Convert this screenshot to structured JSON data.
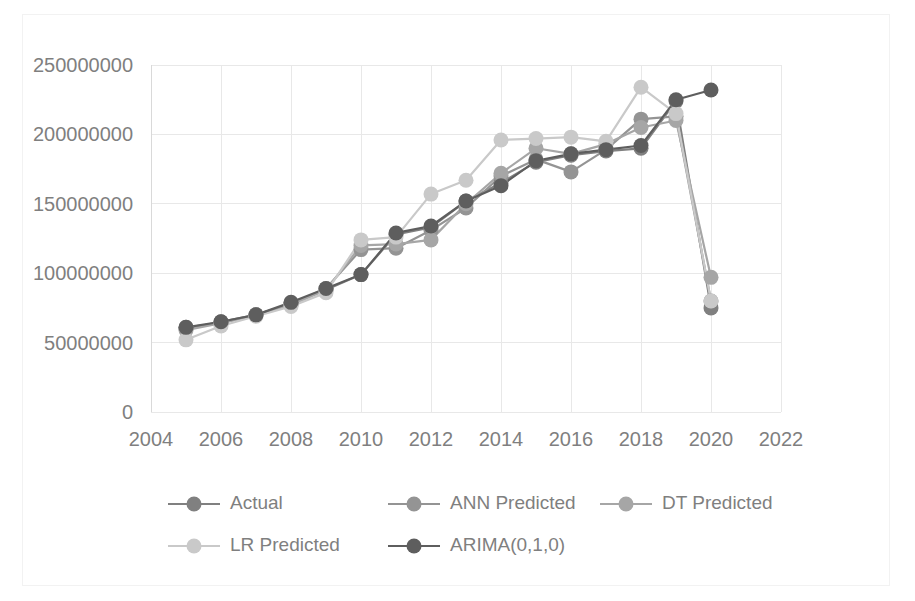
{
  "chart_data": {
    "type": "line",
    "title": "",
    "subtitle": "",
    "xlabel": "",
    "ylabel": "",
    "x": [
      2005,
      2006,
      2007,
      2008,
      2009,
      2010,
      2011,
      2012,
      2013,
      2014,
      2015,
      2016,
      2017,
      2018,
      2019,
      2020
    ],
    "xlim": [
      2004,
      2022
    ],
    "ylim": [
      0,
      250000000
    ],
    "xticks": [
      2004,
      2006,
      2008,
      2010,
      2012,
      2014,
      2016,
      2018,
      2020,
      2022
    ],
    "xtick_labels": [
      "2004",
      "2006",
      "2008",
      "2010",
      "2012",
      "2014",
      "2016",
      "2018",
      "2020",
      "2022"
    ],
    "yticks": [
      0,
      50000000,
      100000000,
      150000000,
      200000000,
      250000000
    ],
    "ytick_labels": [
      "0",
      "50000000",
      "100000000",
      "150000000",
      "200000000",
      "250000000"
    ],
    "grid": true,
    "grid_axis": "both",
    "legend_position": "bottom",
    "markers": "circle",
    "series": [
      {
        "name": "Actual",
        "color": "#808080",
        "values": [
          60000000,
          65000000,
          70000000,
          78000000,
          88000000,
          99000000,
          128000000,
          133000000,
          152000000,
          165000000,
          180000000,
          185000000,
          188000000,
          190000000,
          224000000,
          75000000
        ]
      },
      {
        "name": "ANN Predicted",
        "color": "#949494",
        "values": [
          61000000,
          64000000,
          70000000,
          78000000,
          89000000,
          117000000,
          118000000,
          131000000,
          147000000,
          170000000,
          182000000,
          173000000,
          189000000,
          211000000,
          213000000,
          80000000
        ]
      },
      {
        "name": "DT Predicted",
        "color": "#a6a6a6",
        "values": [
          59000000,
          64000000,
          70000000,
          77000000,
          88000000,
          120000000,
          121000000,
          124000000,
          150000000,
          172000000,
          190000000,
          186000000,
          193000000,
          205000000,
          210000000,
          97000000
        ]
      },
      {
        "name": "LR Predicted",
        "color": "#c9c9c9",
        "values": [
          52000000,
          62000000,
          69000000,
          76000000,
          86000000,
          124000000,
          126000000,
          157000000,
          167000000,
          196000000,
          197000000,
          198000000,
          195000000,
          234000000,
          215000000,
          80000000
        ]
      },
      {
        "name": "ARIMA(0,1,0)",
        "color": "#5e5e5e",
        "values": [
          61000000,
          65000000,
          70000000,
          79000000,
          89000000,
          99000000,
          129000000,
          134000000,
          152000000,
          163000000,
          181000000,
          186000000,
          189000000,
          192000000,
          225000000,
          232000000
        ]
      }
    ]
  },
  "legend": {
    "items": [
      {
        "label": "Actual"
      },
      {
        "label": "ANN Predicted"
      },
      {
        "label": "DT Predicted"
      },
      {
        "label": "LR Predicted"
      },
      {
        "label": "ARIMA(0,1,0)"
      }
    ]
  }
}
